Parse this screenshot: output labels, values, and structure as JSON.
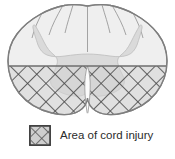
{
  "figure": {
    "name": "spinal-cord-cross-section"
  },
  "legend": {
    "label": "Area of cord injury",
    "swatch_pattern": "crosshatch",
    "swatch_border_color": "#3a3a3a",
    "swatch_fill_color": "#c9c9c9",
    "swatch_hatch_color": "#555555"
  },
  "diagram": {
    "white_matter_fill": "#eeeeee",
    "gray_matter_fill": "#dadada",
    "outline_color": "#808080",
    "injury_hatch_color": "#4a4a4a",
    "injury_fill_color": "#d2d2d2",
    "fissure_fill": "#fbfbfb",
    "background": "#ffffff",
    "regions": [
      {
        "name": "posterior-white-matter",
        "state": "intact"
      },
      {
        "name": "gray-matter-butterfly",
        "state": "partially-injured"
      },
      {
        "name": "anterior-white-matter",
        "state": "injured"
      },
      {
        "name": "anterior-median-fissure",
        "state": "intact"
      }
    ]
  }
}
